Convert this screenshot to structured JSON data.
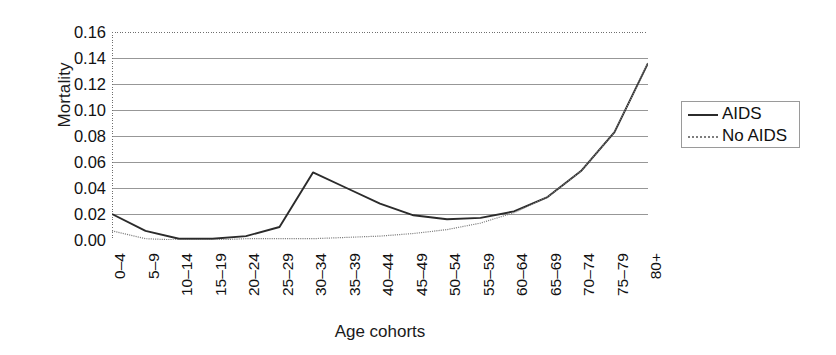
{
  "chart_data": {
    "type": "line",
    "title": "",
    "xlabel": "Age cohorts",
    "ylabel": "Mortality",
    "categories": [
      "0–4",
      "5–9",
      "10–14",
      "15–19",
      "20–24",
      "25–29",
      "30–34",
      "35–39",
      "40–44",
      "45–49",
      "50–54",
      "55–59",
      "60–64",
      "65–69",
      "70–74",
      "75–79",
      "80+"
    ],
    "x_tick_labels": [
      "0–4",
      "5–9",
      "10–14",
      "15–19",
      "20–24",
      "25–29",
      "30–34",
      "35–39",
      "40–44",
      "45–49",
      "50–54",
      "55–59",
      "60–64",
      "65–69",
      "70–74",
      "75–79",
      "80+"
    ],
    "y_tick_labels": [
      "0.00",
      "0.02",
      "0.04",
      "0.06",
      "0.08",
      "0.10",
      "0.12",
      "0.14",
      "0.16"
    ],
    "y_tick_values": [
      0.0,
      0.02,
      0.04,
      0.06,
      0.08,
      0.1,
      0.12,
      0.14,
      0.16
    ],
    "ylim": [
      0.0,
      0.16
    ],
    "grid": "horizontal",
    "legend_position": "right-outside",
    "series": [
      {
        "name": "AIDS",
        "style": "solid",
        "color": "#2b2b2b",
        "values": [
          0.02,
          0.007,
          0.001,
          0.001,
          0.003,
          0.01,
          0.052,
          0.04,
          0.028,
          0.019,
          0.016,
          0.017,
          0.022,
          0.033,
          0.053,
          0.083,
          0.136
        ]
      },
      {
        "name": "No AIDS",
        "style": "dotted",
        "color": "#7d7d7d",
        "values": [
          0.007,
          0.001,
          0.0,
          0.0,
          0.001,
          0.001,
          0.001,
          0.002,
          0.003,
          0.005,
          0.008,
          0.013,
          0.021,
          0.033,
          0.053,
          0.083,
          0.136
        ]
      }
    ]
  },
  "axes": {
    "y_title": "Mortality",
    "x_title": "Age cohorts"
  },
  "legend": {
    "entries": [
      {
        "label": "AIDS",
        "marker": "solid-line-marker"
      },
      {
        "label": "No AIDS",
        "marker": "dotted-line-marker"
      }
    ]
  },
  "colors": {
    "aids_line": "#2b2b2b",
    "no_aids_line": "#7d7d7d",
    "gridline": "#8c8c8c",
    "axis": "#6e6e6e",
    "text": "#111111",
    "background": "#ffffff"
  }
}
